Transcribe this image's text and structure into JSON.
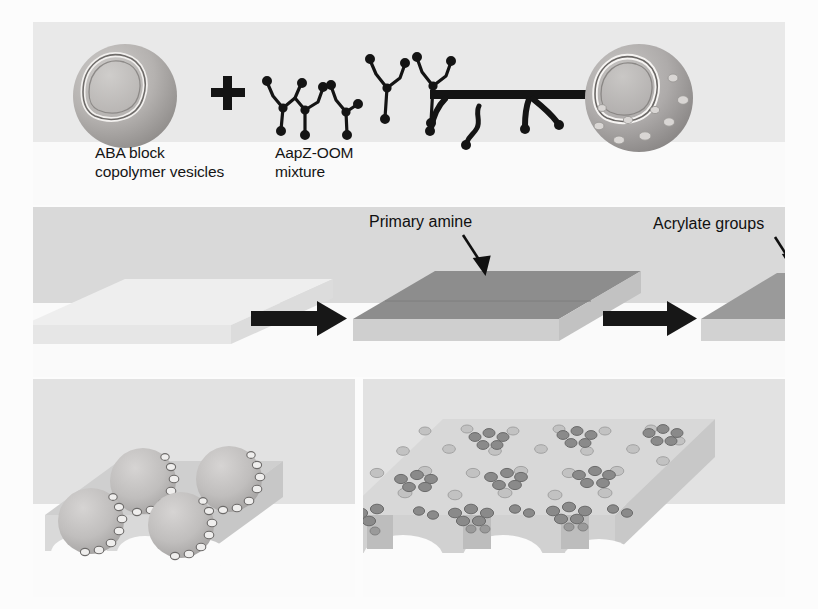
{
  "figure": {
    "background_color": "#fcfcfc",
    "panel_background": "#e9e9e9"
  },
  "panels": {
    "top": {
      "name": "vesicle-assembly-panel",
      "background": "#e9e9e9",
      "captions": [
        {
          "id": "vesicle-caption",
          "line1": "ABA block",
          "line2": "copolymer vesicles"
        },
        {
          "id": "mixture-caption",
          "line1": "AapZ-OOM",
          "line2": "mixture"
        }
      ],
      "plus_symbol": "+",
      "items": [
        {
          "id": "plain-vesicle",
          "type": "sphere",
          "has_pores": false,
          "fill": "#b3b0ae"
        },
        {
          "id": "aapz-oom-molecules",
          "type": "branched-molecules",
          "count": 5,
          "color": "#1a1a1a"
        },
        {
          "id": "reaction-arrow",
          "type": "arrow-with-ligands",
          "color": "#111111"
        },
        {
          "id": "porous-vesicle",
          "type": "sphere",
          "has_pores": true,
          "fill": "#aeabaa",
          "pore_count": 9
        }
      ]
    },
    "middle": {
      "name": "substrate-functionalization-panel",
      "background": "#d9d9d9",
      "annotations": [
        {
          "id": "primary-amine-label",
          "text": "Primary amine",
          "arrow": "down-left"
        },
        {
          "id": "acrylate-groups-label",
          "text": "Acrylate groups",
          "arrow": "down-left"
        }
      ],
      "slabs": [
        {
          "id": "bare-substrate",
          "top_face": "#ececec",
          "front_face": "#e4e4e4",
          "side_face": "#dedede"
        },
        {
          "id": "amine-functionalized-substrate",
          "top_face": "#8e8e8e",
          "front_face": "#cfcfcf",
          "side_face": "#c4c4c4"
        },
        {
          "id": "acrylate-functionalized-substrate",
          "top_face": "#9b9b9b",
          "front_face": "#d2d2d2",
          "side_face": "#c7c7c7"
        }
      ],
      "arrows": [
        {
          "id": "step-arrow-1",
          "direction": "right",
          "color": "#141414"
        },
        {
          "id": "step-arrow-2",
          "direction": "right",
          "color": "#141414"
        }
      ]
    },
    "bottom_left": {
      "name": "vesicle-deposition-panel",
      "background": "#e2e2e2",
      "slab": {
        "id": "substrate-slab",
        "top_face": "#cfcfcf",
        "front_face": "#d9d9d9",
        "side_face": "#cacaca"
      },
      "vesicles": {
        "id": "deposited-vesicles",
        "count": 4,
        "has_pore_ring": true,
        "fill": "#c2c0bf"
      }
    },
    "bottom_right": {
      "name": "nanoporous-membrane-panel",
      "background": "#e2e2e2",
      "membrane": {
        "id": "porous-membrane-slab",
        "top_face": "#d6d6d6",
        "front_face": "#d0d0d0",
        "side_face": "#c8c8c8"
      },
      "features": {
        "ruptured_vesicles": 6,
        "small_pores": 40,
        "channels": 3,
        "pore_color": "#9a9a9a",
        "vesicle_cluster_color": "#8a8a8a"
      }
    }
  },
  "colors": {
    "ink": "#141414",
    "panel_light": "#e9e9e9",
    "panel_mid": "#d9d9d9",
    "panel_bottom": "#e2e2e2",
    "white_base": "#fafafa"
  }
}
